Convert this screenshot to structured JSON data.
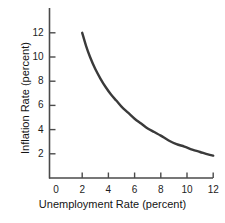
{
  "chart_data": {
    "type": "line",
    "title": "",
    "subtitle": "",
    "xlabel": "Unemployment Rate (percent)",
    "ylabel": "Inflation Rate (percent)",
    "xlim": [
      0,
      13
    ],
    "ylim": [
      0,
      13
    ],
    "xticks": [
      0,
      2,
      4,
      6,
      8,
      10,
      12
    ],
    "xtick_labels": [
      "0",
      "2",
      "4",
      "6",
      "8",
      "10",
      "12"
    ],
    "yticks": [
      2,
      4,
      6,
      8,
      10,
      12
    ],
    "ytick_labels": [
      "2",
      "4",
      "6",
      "8",
      "10",
      "12"
    ],
    "y_zero_label": "0",
    "grid": false,
    "legend": null,
    "annotations": [],
    "series": [
      {
        "name": "Phillips curve",
        "color": "#3a3a3a",
        "line_width": 2.4,
        "x": [
          2.0,
          2.3,
          2.6,
          3.0,
          3.4,
          3.8,
          4.2,
          4.6,
          5.0,
          5.5,
          6.0,
          6.5,
          7.0,
          7.5,
          8.0,
          8.6,
          9.2,
          9.8,
          10.4,
          11.0,
          11.6,
          12.0
        ],
        "values": [
          12.0,
          10.9,
          10.0,
          9.0,
          8.2,
          7.5,
          6.9,
          6.4,
          5.9,
          5.4,
          4.9,
          4.5,
          4.1,
          3.8,
          3.5,
          3.1,
          2.8,
          2.6,
          2.35,
          2.15,
          1.95,
          1.85
        ]
      }
    ]
  },
  "axis": {
    "x_title": "Unemployment Rate (percent)",
    "y_title": "Inflation Rate (percent)"
  }
}
